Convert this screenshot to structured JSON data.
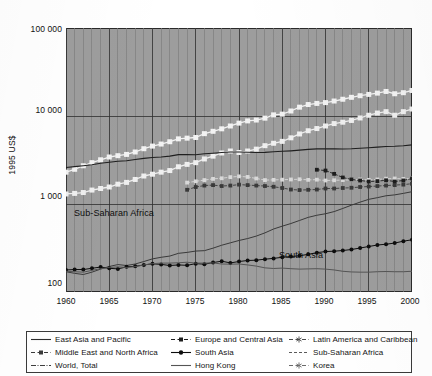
{
  "axes": {
    "ylabel": "1995 US$",
    "yticks": [
      "100 000",
      "10 000",
      "1 000",
      "100"
    ],
    "ytick_values": [
      100000,
      10000,
      1000,
      100
    ],
    "xticks": [
      "1960",
      "1965",
      "1970",
      "1975",
      "1980",
      "1985",
      "1990",
      "1995",
      "2000"
    ],
    "xtick_values": [
      1960,
      1965,
      1970,
      1975,
      1980,
      1985,
      1990,
      1995,
      2000
    ],
    "ylim": [
      100,
      100000
    ],
    "xlim": [
      1960,
      2000
    ],
    "yscale": "log",
    "grid": "vertical-every-year + horizontal-at-decades"
  },
  "annotations": [
    {
      "text": "Sub-Saharan Africa",
      "x": 1962.0,
      "y": 620
    },
    {
      "text": "South Asia",
      "x": 1988.5,
      "y": 195
    }
  ],
  "legend": {
    "position": "below-plot",
    "columns": 3,
    "items": [
      {
        "label": "East Asia and Pacific",
        "key": "solid-line",
        "color": "#2b2b2b",
        "marker": "none"
      },
      {
        "label": "Europe and Central Asia",
        "key": "dash-square",
        "color": "#1d1d1d",
        "marker": "square"
      },
      {
        "label": "Latin America and Caribbean",
        "key": "dash-star",
        "color": "#4a4a4a",
        "marker": "star"
      },
      {
        "label": "Middle East and North Africa",
        "key": "dash-square",
        "color": "#3a3a3a",
        "marker": "square"
      },
      {
        "label": "South Asia",
        "key": "dot-circle",
        "color": "#0d0d0d",
        "marker": "circle"
      },
      {
        "label": "Sub-Saharan Africa",
        "key": "dashed-line",
        "color": "#5a5a5a",
        "marker": "none"
      },
      {
        "label": "World, Total",
        "key": "dash-dot",
        "color": "#3d3d3d",
        "marker": "none"
      },
      {
        "label": "Hong Kong",
        "key": "solid-line",
        "color": "#555555",
        "marker": "none"
      },
      {
        "label": "Korea",
        "key": "dash-star",
        "color": "#6a6a6a",
        "marker": "star"
      }
    ]
  },
  "chart_data": {
    "type": "line",
    "title": "",
    "xlabel": "",
    "ylabel": "1995 US$",
    "yscale": "log",
    "ylim": [
      100,
      100000
    ],
    "xlim": [
      1960,
      2000
    ],
    "x": [
      1960,
      1961,
      1962,
      1963,
      1964,
      1965,
      1966,
      1967,
      1968,
      1969,
      1970,
      1971,
      1972,
      1973,
      1974,
      1975,
      1976,
      1977,
      1978,
      1979,
      1980,
      1981,
      1982,
      1983,
      1984,
      1985,
      1986,
      1987,
      1988,
      1989,
      1990,
      1991,
      1992,
      1993,
      1994,
      1995,
      1996,
      1997,
      1998,
      1999,
      2000
    ],
    "series": [
      {
        "name": "Hong Kong",
        "style": "line-marker-light",
        "color": "#f2f2f2",
        "marker": "square",
        "values": [
          2300,
          2480,
          2720,
          2950,
          3180,
          3420,
          3540,
          3660,
          3900,
          4250,
          4550,
          4800,
          5100,
          5500,
          5600,
          5700,
          6300,
          6700,
          7150,
          7700,
          8300,
          8800,
          9000,
          9450,
          10300,
          10500,
          11400,
          12600,
          13500,
          13900,
          14200,
          14800,
          15500,
          16300,
          17000,
          17600,
          18200,
          19000,
          17900,
          18400,
          19500
        ]
      },
      {
        "name": "Korea",
        "style": "line-marker-light",
        "color": "#efefef",
        "marker": "square",
        "values": [
          1300,
          1320,
          1350,
          1440,
          1500,
          1560,
          1680,
          1760,
          1900,
          2080,
          2180,
          2300,
          2400,
          2650,
          2820,
          2950,
          3250,
          3500,
          3800,
          4000,
          3850,
          4000,
          4200,
          4600,
          4900,
          5150,
          5650,
          6250,
          6800,
          7200,
          7700,
          8200,
          8500,
          8900,
          9500,
          10200,
          10800,
          11200,
          10200,
          11200,
          12000
        ]
      },
      {
        "name": "World, Total",
        "style": "dash-dot",
        "color": "#1f1f1f",
        "marker": "none",
        "values": [
          2600,
          2660,
          2720,
          2790,
          2900,
          2980,
          3060,
          3100,
          3200,
          3300,
          3380,
          3420,
          3500,
          3640,
          3650,
          3630,
          3720,
          3780,
          3850,
          3900,
          3900,
          3880,
          3850,
          3860,
          3920,
          3970,
          4020,
          4090,
          4180,
          4230,
          4250,
          4230,
          4220,
          4240,
          4300,
          4360,
          4430,
          4510,
          4540,
          4600,
          4700
        ]
      },
      {
        "name": "Latin America and Caribbean",
        "style": "dash-star",
        "color": "#d8d8d8",
        "marker": "star",
        "values": [
          null,
          null,
          null,
          null,
          null,
          null,
          null,
          null,
          null,
          null,
          null,
          null,
          null,
          null,
          1750,
          1810,
          1870,
          1930,
          1960,
          2020,
          2060,
          2030,
          1950,
          1870,
          1880,
          1890,
          1900,
          1910,
          1880,
          1890,
          1850,
          1860,
          1870,
          1880,
          1900,
          1880,
          1900,
          1940,
          1950,
          1930,
          1960
        ]
      },
      {
        "name": "Middle East and North Africa",
        "style": "dash-square",
        "color": "#3a3a3a",
        "marker": "square",
        "values": [
          null,
          null,
          null,
          null,
          null,
          null,
          null,
          null,
          null,
          null,
          null,
          null,
          null,
          null,
          1450,
          1560,
          1620,
          1640,
          1600,
          1620,
          1660,
          1640,
          1620,
          1600,
          1570,
          1520,
          1460,
          1440,
          1450,
          1460,
          1500,
          1500,
          1520,
          1530,
          1560,
          1580,
          1600,
          1620,
          1640,
          1660,
          1700
        ]
      },
      {
        "name": "East Asia and Pacific",
        "style": "solid-line",
        "color": "#3a3a3a",
        "marker": "none",
        "values": [
          170,
          163,
          158,
          168,
          182,
          195,
          205,
          200,
          208,
          222,
          238,
          248,
          256,
          275,
          282,
          292,
          295,
          315,
          340,
          362,
          385,
          405,
          432,
          470,
          520,
          560,
          600,
          650,
          705,
          745,
          775,
          820,
          890,
          970,
          1050,
          1130,
          1180,
          1240,
          1270,
          1320,
          1380
        ]
      },
      {
        "name": "South Asia",
        "style": "dot-circle",
        "color": "#0d0d0d",
        "marker": "circle",
        "values": [
          178,
          180,
          180,
          186,
          192,
          186,
          183,
          193,
          196,
          203,
          209,
          206,
          200,
          203,
          201,
          210,
          207,
          216,
          224,
          214,
          222,
          228,
          230,
          236,
          241,
          248,
          253,
          258,
          268,
          280,
          288,
          291,
          296,
          304,
          316,
          329,
          342,
          349,
          360,
          378,
          392
        ]
      },
      {
        "name": "Sub-Saharan Africa",
        "style": "dashed-line",
        "color": "#555555",
        "marker": "none",
        "values": [
          172,
          170,
          168,
          176,
          184,
          190,
          193,
          190,
          194,
          203,
          210,
          213,
          213,
          215,
          218,
          213,
          213,
          214,
          208,
          207,
          208,
          203,
          197,
          188,
          185,
          187,
          184,
          182,
          183,
          184,
          182,
          178,
          172,
          169,
          168,
          168,
          170,
          171,
          170,
          170,
          172
        ]
      },
      {
        "name": "Europe and Central Asia",
        "style": "dash-square",
        "color": "#1d1d1d",
        "marker": "square",
        "values": [
          null,
          null,
          null,
          null,
          null,
          null,
          null,
          null,
          null,
          null,
          null,
          null,
          null,
          null,
          null,
          null,
          null,
          null,
          null,
          null,
          null,
          null,
          null,
          null,
          null,
          null,
          null,
          null,
          null,
          2450,
          2400,
          2200,
          2000,
          1900,
          1850,
          1800,
          1820,
          1860,
          1800,
          1850,
          1950
        ]
      }
    ]
  }
}
